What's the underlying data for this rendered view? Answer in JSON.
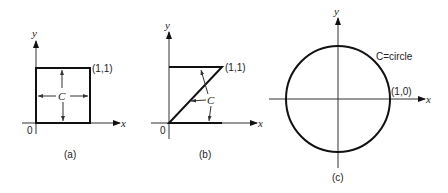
{
  "figures": [
    {
      "id": "a",
      "caption": "(a)",
      "axis_x_label": "x",
      "axis_y_label": "y",
      "origin_label": "0",
      "point_label": "(1,1)",
      "curve_label": "C",
      "description": "Unit square boundary with counterclockwise orientation arrows"
    },
    {
      "id": "b",
      "caption": "(b)",
      "axis_x_label": "x",
      "axis_y_label": "y",
      "origin_label": "0",
      "point_label": "(1,1)",
      "curve_label": "C",
      "description": "Z-shaped path: bottom segment, diagonal to (1,1), top segment"
    },
    {
      "id": "c",
      "caption": "(c)",
      "axis_x_label": "x",
      "axis_y_label": "y",
      "point_label": "(1,0)",
      "curve_label": "C=circle",
      "description": "Unit circle centered at origin"
    }
  ],
  "colors": {
    "line": "#111111",
    "text": "#222222",
    "background": "#ffffff"
  }
}
